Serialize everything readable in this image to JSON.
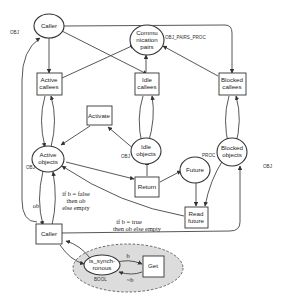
{
  "diagram": {
    "nodes": {
      "caller_top": {
        "label": "Caller",
        "type": "place",
        "annotation": "OBJ"
      },
      "communication_pairs": {
        "line1": "Commu",
        "line2": "nication",
        "line3": "pairs",
        "type": "place",
        "annotation": "OBJ_PAIRS_PROC"
      },
      "active_callees": {
        "line1": "Active",
        "line2": "callees",
        "type": "transition"
      },
      "idle_callees": {
        "line1": "Idle",
        "line2": "callees",
        "type": "transition"
      },
      "blocked_callees": {
        "line1": "Blocked",
        "line2": "callees",
        "type": "transition"
      },
      "activate": {
        "label": "Activate",
        "type": "transition"
      },
      "active_objects": {
        "line1": "Active",
        "line2": "objects",
        "type": "place",
        "annotation": "OBJ"
      },
      "idle_objects": {
        "line1": "Idle",
        "line2": "objects",
        "type": "place",
        "annotation": "OBJ"
      },
      "blocked_objects": {
        "line1": "Blocked",
        "line2": "objects",
        "type": "place",
        "annotation": "OBJ"
      },
      "return": {
        "label": "Return",
        "type": "transition"
      },
      "future": {
        "label": "Future",
        "type": "place",
        "annotation": "PROC"
      },
      "read_future": {
        "line1": "Read",
        "line2": "future",
        "type": "transition"
      },
      "caller_bottom": {
        "label": "Caller",
        "type": "transition"
      },
      "is_synchronous": {
        "line1": "is_synch-",
        "line2": "ronous",
        "type": "place",
        "annotation": "BOOL"
      },
      "get": {
        "label": "Get",
        "type": "transition"
      }
    },
    "edge_labels": {
      "ob": "ob",
      "cond_false_1": "if b = false",
      "cond_false_2": "then ob",
      "cond_false_3": "else empty",
      "cond_true_1": "if b = true",
      "cond_true_2": "then ob else empty",
      "b": "b",
      "not_b": "~b"
    }
  }
}
